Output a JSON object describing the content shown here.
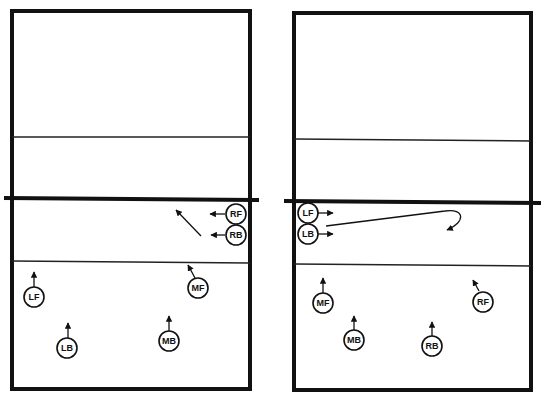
{
  "diagram": {
    "courts": [
      {
        "id": "left",
        "players": [
          {
            "label": "RF",
            "move": "left"
          },
          {
            "label": "RB",
            "move": "left-then-diagonal"
          },
          {
            "label": "MF",
            "move": "toward-attack-line"
          },
          {
            "label": "LF",
            "move": "forward"
          },
          {
            "label": "LB",
            "move": "forward"
          },
          {
            "label": "MB",
            "move": "forward"
          }
        ]
      },
      {
        "id": "right",
        "players": [
          {
            "label": "LF",
            "move": "right"
          },
          {
            "label": "LB",
            "move": "right-then-loop-back"
          },
          {
            "label": "MF",
            "move": "forward"
          },
          {
            "label": "RF",
            "move": "toward-attack-line"
          },
          {
            "label": "MB",
            "move": "forward"
          },
          {
            "label": "RB",
            "move": "forward"
          }
        ]
      }
    ],
    "colors": {
      "ink": "#111111",
      "background": "#ffffff"
    }
  }
}
